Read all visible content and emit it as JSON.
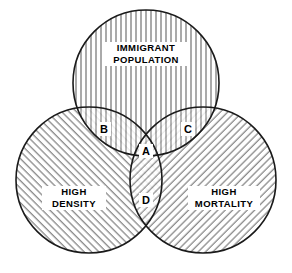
{
  "diagram": {
    "type": "venn-3-set",
    "title_present": false,
    "background_color": "#ffffff",
    "outline_color": "#1a1a1a",
    "hatch_color": "#555555"
  },
  "sets": [
    {
      "id": "immigrant-population",
      "label_line1": "IMMIGRANT",
      "label_line2": "POPULATION",
      "hatch": "vertical",
      "cx": 146,
      "cy": 83,
      "r": 73,
      "label_x": 146,
      "label_y": 52
    },
    {
      "id": "high-density",
      "label_line1": "HIGH",
      "label_line2": "DENSITY",
      "hatch": "diagonal-up",
      "cx": 89,
      "cy": 180,
      "r": 73,
      "label_x": 74,
      "label_y": 196
    },
    {
      "id": "high-mortality",
      "label_line1": "HIGH",
      "label_line2": "MORTALITY",
      "hatch": "diagonal-down",
      "cx": 203,
      "cy": 180,
      "r": 73,
      "label_x": 224,
      "label_y": 196
    }
  ],
  "regions": [
    {
      "id": "region-a",
      "label": "A",
      "description": "all three sets",
      "x": 146,
      "y": 151
    },
    {
      "id": "region-b",
      "label": "B",
      "description": "immigrant population and high density",
      "x": 104,
      "y": 129
    },
    {
      "id": "region-c",
      "label": "C",
      "description": "immigrant population and high mortality",
      "x": 188,
      "y": 129
    },
    {
      "id": "region-d",
      "label": "D",
      "description": "high density and high mortality",
      "x": 146,
      "y": 200
    }
  ]
}
